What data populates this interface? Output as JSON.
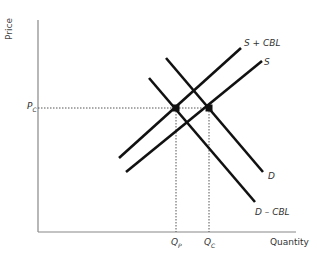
{
  "axes": {
    "y_label": "Price",
    "x_label": "Quantity"
  },
  "curves": [
    {
      "id": "s_plus_cbl",
      "label": "S + CBL",
      "x1": 119,
      "y1": 158,
      "x2": 241,
      "y2": 48
    },
    {
      "id": "s",
      "label": "S",
      "x1": 126,
      "y1": 172,
      "x2": 262,
      "y2": 61
    },
    {
      "id": "d",
      "label": "D",
      "x1": 166,
      "y1": 58,
      "x2": 263,
      "y2": 172
    },
    {
      "id": "d_minus_cbl",
      "label": "D – CBL",
      "x1": 149,
      "y1": 78,
      "x2": 255,
      "y2": 202
    }
  ],
  "equilibria": [
    {
      "id": "private",
      "x": 176,
      "y": 108,
      "q_label": "Q",
      "q_sub": "P"
    },
    {
      "id": "consumer",
      "x": 209,
      "y": 108,
      "q_label": "Q",
      "q_sub": "C"
    }
  ],
  "price_label": {
    "main": "P",
    "sub": "C"
  },
  "colors": {
    "line": "#111111",
    "axis": "#777777",
    "dotted": "#555555"
  }
}
